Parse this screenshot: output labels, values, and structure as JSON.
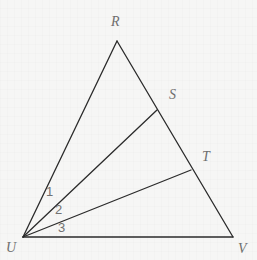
{
  "figure": {
    "type": "geometry-diagram",
    "canvas": {
      "width": 257,
      "height": 260
    },
    "background_color": "#f6f6f5",
    "stroke_color": "#2b2b2b",
    "label_color": "#6e6e6e",
    "stroke_width": 1.3,
    "points": [
      {
        "id": "R",
        "label": "R",
        "x": 117,
        "y": 41,
        "label_x": 116,
        "label_y": 22
      },
      {
        "id": "S",
        "label": "S",
        "x": 157,
        "y": 110,
        "label_x": 174,
        "label_y": 95
      },
      {
        "id": "T",
        "label": "T",
        "x": 191,
        "y": 170,
        "label_x": 206,
        "label_y": 157
      },
      {
        "id": "U",
        "label": "U",
        "x": 23,
        "y": 237,
        "label_x": 11,
        "label_y": 248
      },
      {
        "id": "V",
        "label": "V",
        "x": 233,
        "y": 237,
        "label_x": 242,
        "label_y": 249
      }
    ],
    "segments": [
      {
        "id": "UR",
        "from": "U",
        "to": "R",
        "x1": 23,
        "y1": 237,
        "x2": 117,
        "y2": 41
      },
      {
        "id": "RV",
        "from": "R",
        "to": "V",
        "x1": 117,
        "y1": 41,
        "x2": 233,
        "y2": 237
      },
      {
        "id": "UV",
        "from": "U",
        "to": "V",
        "x1": 23,
        "y1": 237,
        "x2": 233,
        "y2": 237
      },
      {
        "id": "US",
        "from": "U",
        "to": "S",
        "x1": 23,
        "y1": 237,
        "x2": 157,
        "y2": 110
      },
      {
        "id": "UT",
        "from": "U",
        "to": "T",
        "x1": 23,
        "y1": 237,
        "x2": 191,
        "y2": 170
      }
    ],
    "angles": [
      {
        "id": "angle-1",
        "label": "1",
        "x": 50,
        "y": 192,
        "between": "UR and US"
      },
      {
        "id": "angle-2",
        "label": "2",
        "x": 59,
        "y": 210,
        "between": "US and UT"
      },
      {
        "id": "angle-3",
        "label": "3",
        "x": 62,
        "y": 228,
        "between": "UT and UV"
      }
    ]
  }
}
